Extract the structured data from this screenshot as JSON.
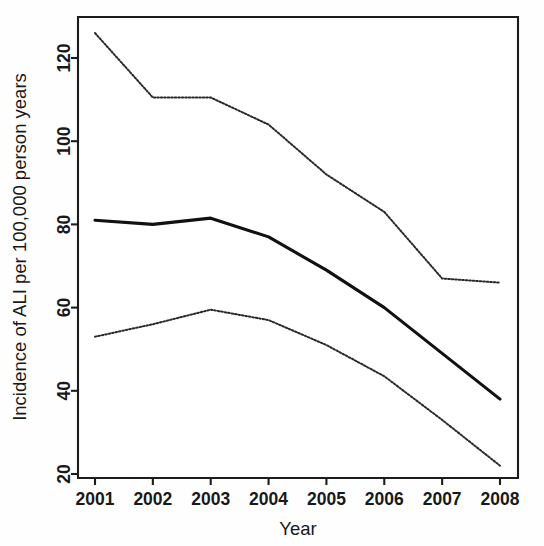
{
  "chart_data": {
    "type": "line",
    "title": "",
    "subtitle": "",
    "xlabel": "Year",
    "ylabel": "Incidence of ALI per 100,000 person years",
    "x": [
      2001,
      2002,
      2003,
      2004,
      2005,
      2006,
      2007,
      2008
    ],
    "xtick_labels": [
      "2001",
      "2002",
      "2003",
      "2004",
      "2005",
      "2006",
      "2007",
      "2008"
    ],
    "ytick_labels": [
      "20",
      "40",
      "60",
      "80",
      "100",
      "120"
    ],
    "ytick_values": [
      20,
      40,
      60,
      80,
      100,
      120
    ],
    "xlim": [
      2001,
      2008
    ],
    "ylim": [
      16,
      130
    ],
    "grid": false,
    "legend": "none",
    "series": [
      {
        "name": "Upper 95% confidence limit",
        "style": "dotted",
        "values": [
          126,
          110.5,
          110.5,
          104,
          92,
          83,
          67,
          66
        ]
      },
      {
        "name": "Incidence rate estimate",
        "style": "solid",
        "values": [
          81,
          80,
          81.5,
          77,
          69,
          60,
          49,
          38
        ]
      },
      {
        "name": "Lower 95% confidence limit",
        "style": "dotted",
        "values": [
          53,
          56,
          59.5,
          57,
          51,
          43.5,
          33,
          22
        ]
      }
    ],
    "colors": {
      "axis": "#1c1c1c",
      "solid_line": "#111111",
      "dotted_line": "#2a2a2a",
      "background": "#ffffff"
    }
  },
  "axes": {
    "x_title": "Year",
    "y_title": "Incidence of ALI per 100,000 person years"
  }
}
